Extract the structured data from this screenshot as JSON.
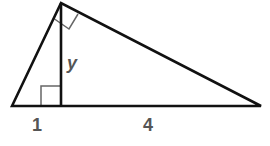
{
  "diagram": {
    "type": "right-triangle-with-altitude",
    "labels": {
      "left_segment": "1",
      "altitude": "y",
      "right_segment": "4"
    },
    "colors": {
      "stroke": "#111111",
      "right_angle_marks": "#666666",
      "label": "#555555"
    }
  }
}
